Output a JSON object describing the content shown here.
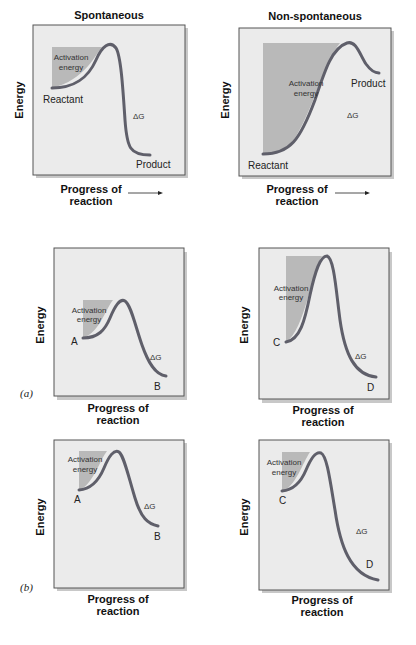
{
  "figure": {
    "top_row": {
      "left": {
        "title": "Spontaneous",
        "y_axis_label": "Energy",
        "x_axis_label_line1": "Progress of",
        "x_axis_label_line2": "reaction",
        "shaded_label_line1": "Activation",
        "shaded_label_line2": "energy",
        "start_label": "Reactant",
        "end_label": "Product",
        "delta_label": "ΔG"
      },
      "right": {
        "title": "Non-spontaneous",
        "y_axis_label": "Energy",
        "x_axis_label_line1": "Progress of",
        "x_axis_label_line2": "reaction",
        "shaded_label_line1": "Activation",
        "shaded_label_line2": "energy",
        "start_label": "Reactant",
        "end_label": "Product",
        "delta_label": "ΔG"
      }
    },
    "row_a": {
      "panel_label": "(a)",
      "left": {
        "y_axis_label": "Energy",
        "x_axis_label_line1": "Progress of",
        "x_axis_label_line2": "reaction",
        "shaded_label_line1": "Activation",
        "shaded_label_line2": "energy",
        "start_label": "A",
        "end_label": "B",
        "delta_label": "ΔG"
      },
      "right": {
        "y_axis_label": "Energy",
        "x_axis_label_line1": "Progress of",
        "x_axis_label_line2": "reaction",
        "shaded_label_line1": "Activation",
        "shaded_label_line2": "energy",
        "start_label": "C",
        "end_label": "D",
        "delta_label": "ΔG"
      }
    },
    "row_b": {
      "panel_label": "(b)",
      "left": {
        "y_axis_label": "Energy",
        "x_axis_label_line1": "Progress of",
        "x_axis_label_line2": "reaction",
        "shaded_label_line1": "Activation",
        "shaded_label_line2": "energy",
        "start_label": "A",
        "end_label": "B",
        "delta_label": "ΔG"
      },
      "right": {
        "y_axis_label": "Energy",
        "x_axis_label_line1": "Progress of",
        "x_axis_label_line2": "reaction",
        "shaded_label_line1": "Activation",
        "shaded_label_line2": "energy",
        "start_label": "C",
        "end_label": "D",
        "delta_label": "ΔG"
      }
    }
  },
  "colors": {
    "panel_background": "#ebebeb",
    "panel_border": "#555555",
    "activation_shading": "#b9b9b9",
    "curve": "#5f5f6a",
    "text": "#111111"
  }
}
